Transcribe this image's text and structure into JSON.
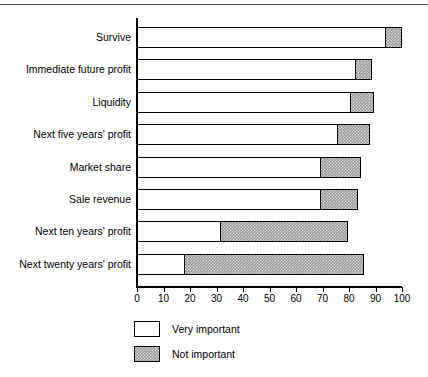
{
  "chart_data": {
    "type": "bar",
    "orientation": "horizontal",
    "stacked": true,
    "title": "",
    "subtitle": "",
    "xlabel": "",
    "ylabel": "",
    "xlim": [
      0,
      100
    ],
    "xticks": [
      0,
      10,
      20,
      30,
      40,
      50,
      60,
      70,
      80,
      90,
      100
    ],
    "xtick_labels": [
      "0",
      "10",
      "20",
      "30",
      "40",
      "50",
      "60",
      "70",
      "80",
      "90",
      "100"
    ],
    "grid": false,
    "legend_position": "bottom-left",
    "categories": [
      "Survive",
      "Immediate future profit",
      "Liquidity",
      "Next five years' profit",
      "Market share",
      "Sale revenue",
      "Next ten years' profit",
      "Next twenty years' profit"
    ],
    "series": [
      {
        "name": "Very important",
        "fill": "white",
        "color": "#ffffff",
        "values": [
          94,
          83,
          81,
          76,
          69.5,
          69.5,
          32,
          18.5
        ]
      },
      {
        "name": "Not important",
        "fill": "hatched-gray",
        "color": "#9a9a9a",
        "values": [
          6,
          5.5,
          8.5,
          12,
          15,
          14,
          47.5,
          67
        ]
      }
    ],
    "cumulative_totals": [
      100,
      88.5,
      89.5,
      88,
      84.5,
      83.5,
      79.5,
      85.5
    ]
  },
  "legend": {
    "items": [
      {
        "label": "Very important",
        "swatch": "white"
      },
      {
        "label": "Not important",
        "swatch": "hatched-gray"
      }
    ]
  },
  "colors": {
    "axis": "#000000",
    "bar_outline": "#000000",
    "very_important": "#ffffff",
    "not_important": "#9a9a9a",
    "background": "#ffffff"
  }
}
